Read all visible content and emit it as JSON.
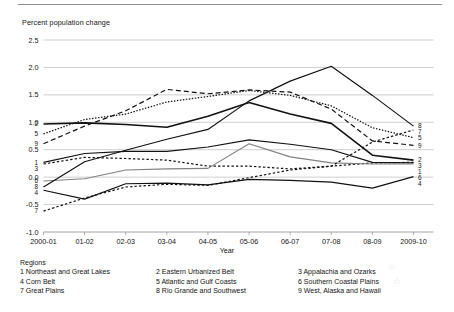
{
  "figure": {
    "y_axis_title": "Percent population change",
    "x_axis_title": "Year",
    "legend_title": "Regions"
  },
  "chart_data": {
    "type": "line",
    "title": "",
    "xlabel": "Year",
    "ylabel": "Percent population change",
    "ylim": [
      -1.0,
      2.5
    ],
    "ytick_labels": [
      "2.5",
      "2.0",
      "1.5",
      "1.0",
      "0.5",
      "0.0",
      "-0.5",
      "-1.0"
    ],
    "ytick_values": [
      2.5,
      2.0,
      1.5,
      1.0,
      0.5,
      0.0,
      -0.5,
      -1.0
    ],
    "grid": true,
    "legend_position": "below-plot",
    "categories": [
      "2000-01",
      "01-02",
      "02-03",
      "03-04",
      "04-05",
      "05-06",
      "06-07",
      "07-08",
      "08-09",
      "2009-10"
    ],
    "series": [
      {
        "name": "Northeast and Great Lakes",
        "number": "1",
        "style": "solid",
        "color": "#121212",
        "values": [
          0.27,
          0.43,
          0.47,
          0.47,
          0.55,
          0.68,
          0.6,
          0.5,
          0.27,
          0.26
        ]
      },
      {
        "name": "Eastern Urbanized Belt",
        "number": "2",
        "style": "solid-thick",
        "color": "#121212",
        "values": [
          0.97,
          0.99,
          0.96,
          0.91,
          1.11,
          1.36,
          1.15,
          0.98,
          0.4,
          0.31
        ]
      },
      {
        "name": "Appalachia and Ozarks",
        "number": "3",
        "style": "dashed-short",
        "color": "#121212",
        "values": [
          0.24,
          0.36,
          0.34,
          0.31,
          0.2,
          0.2,
          0.15,
          0.2,
          0.26,
          0.27
        ]
      },
      {
        "name": "Corn Belt",
        "number": "4",
        "style": "solid",
        "color": "#121212",
        "values": [
          -0.24,
          -0.4,
          -0.12,
          -0.11,
          -0.14,
          -0.04,
          -0.06,
          -0.09,
          -0.2,
          0.01
        ]
      },
      {
        "name": "Atlantic and Gulf Coasts",
        "number": "5",
        "style": "dotted",
        "color": "#121212",
        "values": [
          0.79,
          1.05,
          1.15,
          1.37,
          1.47,
          1.58,
          1.49,
          1.3,
          0.9,
          0.72
        ]
      },
      {
        "name": "Southern Coastal Plains",
        "number": "6",
        "style": "solid-grey",
        "color": "#808080",
        "values": [
          -0.07,
          -0.03,
          0.13,
          0.15,
          0.16,
          0.61,
          0.37,
          0.26,
          0.24,
          0.24
        ]
      },
      {
        "name": "Great Plains",
        "number": "7",
        "style": "dashed-short",
        "color": "#121212",
        "values": [
          -0.62,
          -0.38,
          -0.18,
          -0.13,
          -0.15,
          -0.01,
          0.13,
          0.2,
          0.64,
          0.86
        ]
      },
      {
        "name": "Rio Grande and Southwest",
        "number": "8",
        "style": "solid",
        "color": "#121212",
        "values": [
          -0.18,
          0.28,
          0.49,
          0.69,
          0.87,
          1.39,
          1.75,
          2.02,
          1.49,
          0.93
        ]
      },
      {
        "name": "West, Alaska and Hawaii",
        "number": "9",
        "style": "dashed-long",
        "color": "#121212",
        "values": [
          0.61,
          0.93,
          1.21,
          1.6,
          1.52,
          1.59,
          1.55,
          1.24,
          0.66,
          0.58
        ]
      }
    ],
    "left_labels": [
      "2",
      "5",
      "9",
      "1",
      "3",
      "6",
      "8",
      "4",
      "7"
    ],
    "right_labels": [
      "8",
      "7",
      "5",
      "9",
      "2",
      "3",
      "6",
      "4",
      "1"
    ]
  },
  "legend": {
    "title": "Regions",
    "items": [
      "1 Northeast and Great Lakes",
      "2 Eastern Urbanized Belt",
      "3 Appalachia and Ozarks",
      "4 Corn Belt",
      "5 Atlantic and Gulf Coasts",
      "6 Southern Coastal Plains",
      "7 Great Plains",
      "8 Rio Grande and Southwest",
      "9 West, Alaska and Hawaii"
    ]
  }
}
